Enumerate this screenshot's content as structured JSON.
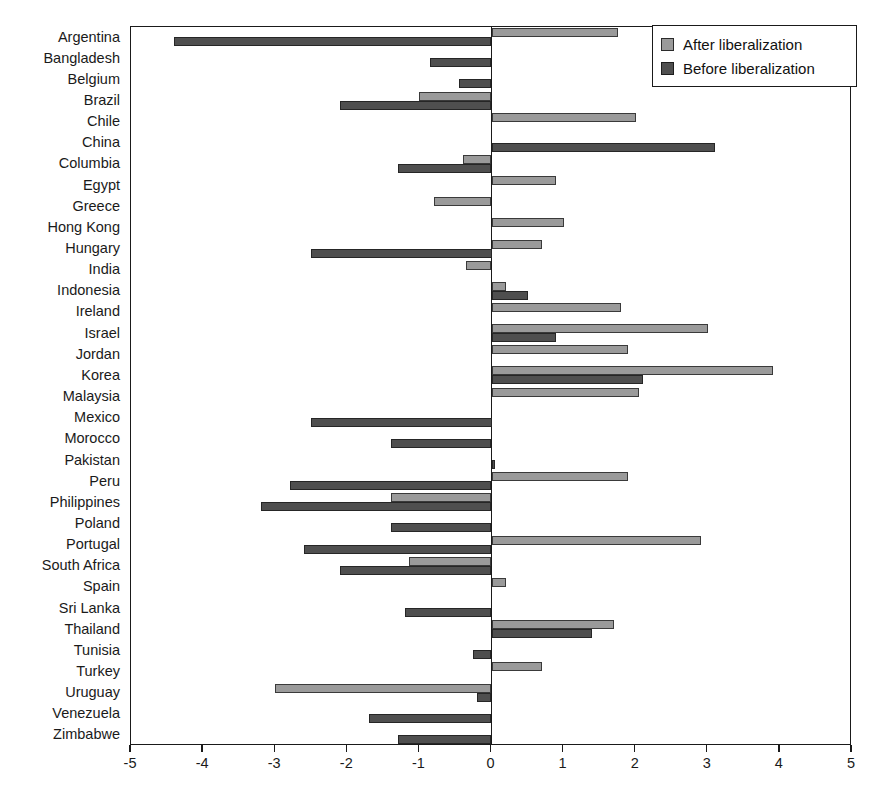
{
  "legend": {
    "position": "top-right",
    "entries": [
      {
        "label": "After liberalization",
        "key": "after",
        "color": "#9a9a9a"
      },
      {
        "label": "Before liberalization",
        "key": "before",
        "color": "#4f4f4f"
      }
    ]
  },
  "axis": {
    "xticks": [
      -5,
      -4,
      -3,
      -2,
      -1,
      0,
      1,
      2,
      3,
      4,
      5
    ],
    "xtick_labels": [
      "-5",
      "-4",
      "-3",
      "-2",
      "-1",
      "0",
      "1",
      "2",
      "3",
      "4",
      "5"
    ],
    "xmin": -5,
    "xmax": 5
  },
  "chart_data": {
    "type": "bar",
    "orientation": "horizontal",
    "title": "",
    "xlabel": "",
    "ylabel": "",
    "xlim": [
      -5,
      5
    ],
    "grid": false,
    "legend_position": "top-right",
    "categories": [
      "Argentina",
      "Bangladesh",
      "Belgium",
      "Brazil",
      "Chile",
      "China",
      "Columbia",
      "Egypt",
      "Greece",
      "Hong Kong",
      "Hungary",
      "India",
      "Indonesia",
      "Ireland",
      "Israel",
      "Jordan",
      "Korea",
      "Malaysia",
      "Mexico",
      "Morocco",
      "Pakistan",
      "Peru",
      "Philippines",
      "Poland",
      "Portugal",
      "South Africa",
      "Spain",
      "Sri Lanka",
      "Thailand",
      "Tunisia",
      "Turkey",
      "Uruguay",
      "Venezuela",
      "Zimbabwe"
    ],
    "series": [
      {
        "name": "After liberalization",
        "color": "#9a9a9a",
        "values": [
          1.75,
          null,
          null,
          -1.0,
          2.0,
          null,
          -0.4,
          0.9,
          -0.8,
          1.0,
          0.7,
          -0.35,
          0.2,
          1.8,
          3.0,
          1.9,
          3.9,
          2.05,
          null,
          null,
          null,
          1.9,
          -1.4,
          null,
          2.9,
          -1.15,
          0.2,
          null,
          1.7,
          null,
          0.7,
          -3.0,
          null,
          null
        ]
      },
      {
        "name": "Before liberalization",
        "color": "#4f4f4f",
        "values": [
          -4.4,
          -0.85,
          -0.45,
          -2.1,
          null,
          3.1,
          -1.3,
          null,
          null,
          null,
          -2.5,
          null,
          0.5,
          null,
          0.9,
          null,
          2.1,
          null,
          -2.5,
          -1.4,
          0.05,
          -2.8,
          -3.2,
          -1.4,
          -2.6,
          -2.1,
          null,
          -1.2,
          1.4,
          -0.25,
          null,
          -0.2,
          -1.7,
          -1.3
        ]
      }
    ]
  }
}
